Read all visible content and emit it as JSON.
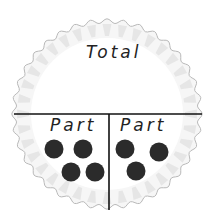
{
  "diagram": {
    "type": "part-part-whole mat",
    "total_label": "Total",
    "parts": [
      {
        "label": "Part",
        "count": 4
      },
      {
        "label": "Part",
        "count": 3
      }
    ],
    "colors": {
      "plate_edge": "#b9b9b9",
      "plate_ridge": "#e4e4e4",
      "line": "#111111",
      "counter": "#2b2b2b"
    }
  }
}
